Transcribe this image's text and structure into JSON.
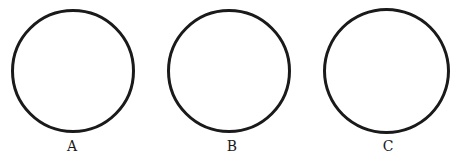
{
  "figure": {
    "stroke_color": "#1a1a1a",
    "background": "#ffffff",
    "circles": [
      {
        "label": "A",
        "cx": 72.5,
        "cy": 71,
        "diameter": 124
      },
      {
        "label": "B",
        "cx": 228.5,
        "cy": 71,
        "diameter": 124
      },
      {
        "label": "C",
        "cx": 386.5,
        "cy": 71,
        "diameter": 127
      }
    ]
  }
}
